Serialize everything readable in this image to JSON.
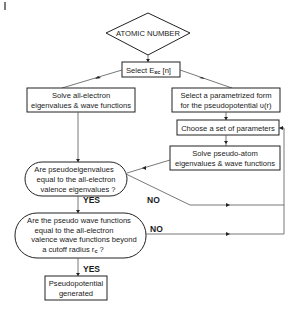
{
  "diagram": {
    "start": {
      "label": "ATOMIC NUMBER"
    },
    "select_exc": {
      "label_main": "Select E",
      "label_sub": "xc",
      "label_tail": " [n]"
    },
    "all_electron": {
      "lines": [
        "Solve all-electron",
        "eigenvalues & wave functions"
      ]
    },
    "parametrized_form": {
      "lines": [
        "Select a parametrized form",
        "for the pseudopotential υ(r)"
      ]
    },
    "choose_params": {
      "label": "Choose a set of parameters"
    },
    "solve_pseudo": {
      "lines": [
        "Solve pseudo-atom",
        "eigenvalues & wave functions"
      ]
    },
    "decision_1": {
      "lines": [
        "Are pseudoeigenvalues",
        "equal to the all-electron",
        "valence eigenvalues ?"
      ]
    },
    "decision_2": {
      "lines": [
        "Are the pseudo wave functions",
        "equal to the all-electron",
        "valence wave functions beyond",
        "a cutoff radius r"
      ],
      "sub": "c",
      "tail": " ?"
    },
    "result": {
      "lines": [
        "Pseudopotential",
        "generated"
      ]
    },
    "edge_labels": {
      "yes_1": "YES",
      "no_1": "NO",
      "yes_2": "YES",
      "no_2": "NO"
    },
    "corner_mark": "|"
  }
}
